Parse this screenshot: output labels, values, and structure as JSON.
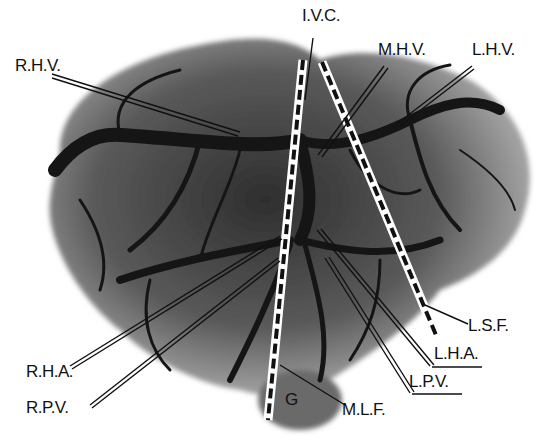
{
  "figure": {
    "colors": {
      "background": "#ffffff",
      "vessel": "#1a1a1a",
      "parenchyma": "#8a8a8a",
      "label": "#111111"
    }
  },
  "labels": {
    "ivc": "I.V.C.",
    "rhv": "R.H.V.",
    "mhv": "M.H.V.",
    "lhv": "L.H.V.",
    "lsf": "L.S.F.",
    "lha": "L.H.A.",
    "lpv": "L.P.V.",
    "rha": "R.H.A.",
    "rpv": "R.P.V.",
    "mlf": "M.L.F.",
    "g": "G"
  }
}
